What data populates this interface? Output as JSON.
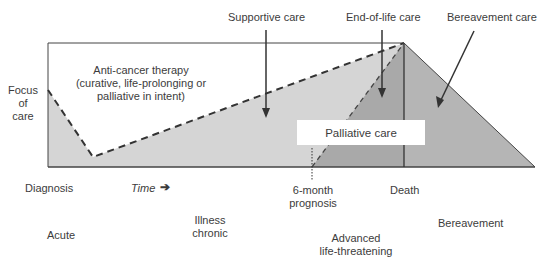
{
  "diagram": {
    "title": "",
    "y_axis_label": "Focus of care",
    "y_axis_lines": [
      "Focus",
      "of",
      "care"
    ],
    "top_labels": {
      "supportive_care": "Supportive care",
      "end_of_life_care": "End-of-life care",
      "bereavement_care": "Bereavement care"
    },
    "anti_cancer_therapy": {
      "line1": "Anti-cancer therapy",
      "line2": "(curative, life-prolonging or",
      "line3": "palliative in intent)"
    },
    "palliative_care_label": "Palliative care",
    "timeline": {
      "diagnosis": "Diagnosis",
      "time_label": "Time",
      "time_arrow": "➔",
      "six_month_line1": "6-month",
      "six_month_line2": "prognosis",
      "death": "Death"
    },
    "phases": {
      "acute": "Acute",
      "illness_chronic_line1": "Illness",
      "illness_chronic_line2": "chronic",
      "advanced_line1": "Advanced",
      "advanced_line2": "life-threatening",
      "bereavement": "Bereavement"
    },
    "colors": {
      "light_fill": "#d4d4d4",
      "dark_fill": "#a8a8a8",
      "bereavement_fill": "#b4b4b4",
      "line": "#3a3a3a",
      "dashed": "#333333"
    }
  }
}
